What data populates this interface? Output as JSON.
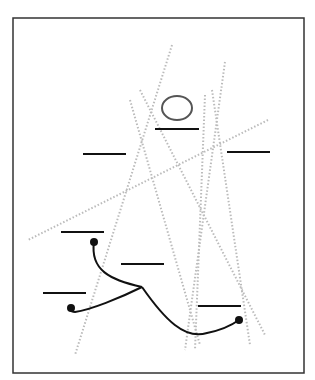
{
  "diagram": {
    "frame": {
      "x": 13,
      "y": 18,
      "w": 291,
      "h": 355,
      "color": "#333333"
    },
    "circle": {
      "cx": 177,
      "cy": 108,
      "rx": 15,
      "ry": 12,
      "color": "#555555"
    },
    "slots": [
      {
        "x1": 155,
        "y1": 129,
        "x2": 199,
        "y2": 129
      },
      {
        "x1": 83,
        "y1": 154,
        "x2": 126,
        "y2": 154
      },
      {
        "x1": 227,
        "y1": 152,
        "x2": 270,
        "y2": 152
      },
      {
        "x1": 61,
        "y1": 232,
        "x2": 104,
        "y2": 232
      },
      {
        "x1": 121,
        "y1": 264,
        "x2": 164,
        "y2": 264
      },
      {
        "x1": 43,
        "y1": 293,
        "x2": 86,
        "y2": 293
      },
      {
        "x1": 198,
        "y1": 306,
        "x2": 241,
        "y2": 306
      }
    ],
    "dotted_lines": [
      {
        "x1": 172,
        "y1": 45,
        "x2": 75,
        "y2": 355
      },
      {
        "x1": 130,
        "y1": 100,
        "x2": 200,
        "y2": 345
      },
      {
        "x1": 140,
        "y1": 90,
        "x2": 265,
        "y2": 335
      },
      {
        "x1": 205,
        "y1": 95,
        "x2": 195,
        "y2": 350
      },
      {
        "x1": 225,
        "y1": 62,
        "x2": 185,
        "y2": 350
      },
      {
        "x1": 212,
        "y1": 90,
        "x2": 250,
        "y2": 345
      },
      {
        "x1": 268,
        "y1": 120,
        "x2": 28,
        "y2": 240
      }
    ],
    "wire_paths": [
      "M 94 242 C 90 270, 110 280, 142 287",
      "M 142 287 C 120 298, 90 310, 75 312 C 70 312, 68 308, 71 306",
      "M 142 287 C 165 320, 185 340, 207 333 C 222 330, 232 325, 239 320"
    ],
    "wire_dots": [
      {
        "cx": 94,
        "cy": 242
      },
      {
        "cx": 71,
        "cy": 308
      },
      {
        "cx": 239,
        "cy": 320
      }
    ],
    "colors": {
      "ink": "#111111",
      "dots": "#bbbbbb"
    }
  }
}
